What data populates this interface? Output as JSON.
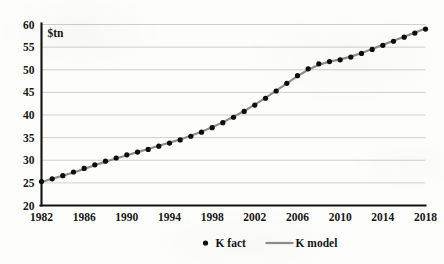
{
  "chart_data": {
    "type": "line",
    "title": "",
    "subtitle": "",
    "xlabel": "",
    "ylabel": "$tn",
    "unit_label": "$tn",
    "xlim": [
      1982,
      2018
    ],
    "ylim": [
      20,
      60
    ],
    "ytick_step": 5,
    "xtick_step": 4,
    "grid": "horizontal",
    "legend_position": "bottom-center",
    "ytick_labels": [
      "20",
      "25",
      "30",
      "35",
      "40",
      "45",
      "50",
      "55",
      "60"
    ],
    "yticks": [
      20,
      25,
      30,
      35,
      40,
      45,
      50,
      55,
      60
    ],
    "xtick_labels": [
      "1982",
      "1986",
      "1990",
      "1994",
      "1998",
      "2002",
      "2006",
      "2010",
      "2014",
      "2018"
    ],
    "xticks": [
      1982,
      1986,
      1990,
      1994,
      1998,
      2002,
      2006,
      2010,
      2014,
      2018
    ],
    "x": [
      1982,
      1983,
      1984,
      1985,
      1986,
      1987,
      1988,
      1989,
      1990,
      1991,
      1992,
      1993,
      1994,
      1995,
      1996,
      1997,
      1998,
      1999,
      2000,
      2001,
      2002,
      2003,
      2004,
      2005,
      2006,
      2007,
      2008,
      2009,
      2010,
      2011,
      2012,
      2013,
      2014,
      2015,
      2016,
      2017,
      2018
    ],
    "series": [
      {
        "name": "K fact",
        "marker": "dot",
        "color": "#0d0d0d",
        "values": [
          25.3,
          25.9,
          26.6,
          27.4,
          28.2,
          29.0,
          29.8,
          30.5,
          31.2,
          31.8,
          32.4,
          33.1,
          33.8,
          34.5,
          35.3,
          36.2,
          37.2,
          38.3,
          39.5,
          40.8,
          42.2,
          43.7,
          45.3,
          47.0,
          48.7,
          50.2,
          51.3,
          51.8,
          52.2,
          52.8,
          53.6,
          54.5,
          55.4,
          56.3,
          57.2,
          58.1,
          59.0
        ]
      },
      {
        "name": "K model",
        "marker": "line",
        "color": "#8e8e8e",
        "values": [
          25.2,
          25.9,
          26.6,
          27.3,
          28.1,
          28.9,
          29.7,
          30.4,
          31.1,
          31.8,
          32.5,
          33.2,
          33.9,
          34.6,
          35.4,
          36.3,
          37.3,
          38.4,
          39.6,
          40.9,
          42.3,
          43.8,
          45.4,
          47.0,
          48.6,
          50.0,
          51.1,
          51.8,
          52.3,
          52.9,
          53.7,
          54.6,
          55.5,
          56.4,
          57.3,
          58.2,
          59.1
        ]
      }
    ],
    "legend": [
      {
        "label": "K fact",
        "marker": "dot",
        "color": "#0d0d0d"
      },
      {
        "label": "K model",
        "marker": "line",
        "color": "#8e8e8e"
      }
    ]
  },
  "colors": {
    "background": "#fdfdfb",
    "axis": "#121212",
    "grid": "#c9c9c9",
    "fact": "#0d0d0d",
    "model": "#8e8e8e"
  }
}
